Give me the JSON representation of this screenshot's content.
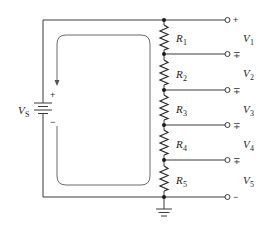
{
  "figure": {
    "type": "voltage divider circuit",
    "source": {
      "label": "V",
      "subscript": "S",
      "plus_sign": "+",
      "minus_sign": "−"
    },
    "resistors": [
      {
        "label": "R",
        "subscript": "1"
      },
      {
        "label": "R",
        "subscript": "2"
      },
      {
        "label": "R",
        "subscript": "3"
      },
      {
        "label": "R",
        "subscript": "4"
      },
      {
        "label": "R",
        "subscript": "5"
      }
    ],
    "outputs": [
      {
        "label": "V",
        "subscript": "1"
      },
      {
        "label": "V",
        "subscript": "2"
      },
      {
        "label": "V",
        "subscript": "3"
      },
      {
        "label": "V",
        "subscript": "4"
      },
      {
        "label": "V",
        "subscript": "5"
      }
    ],
    "terminal_signs": [
      "+",
      "∓",
      "∓",
      "∓",
      "∓",
      "−"
    ],
    "current_loop_direction": "clockwise",
    "ground": "ground-symbol"
  },
  "colors": {
    "wire": "#3a3a3a",
    "loop": "#6a6a6a",
    "background": "#ffffff"
  }
}
